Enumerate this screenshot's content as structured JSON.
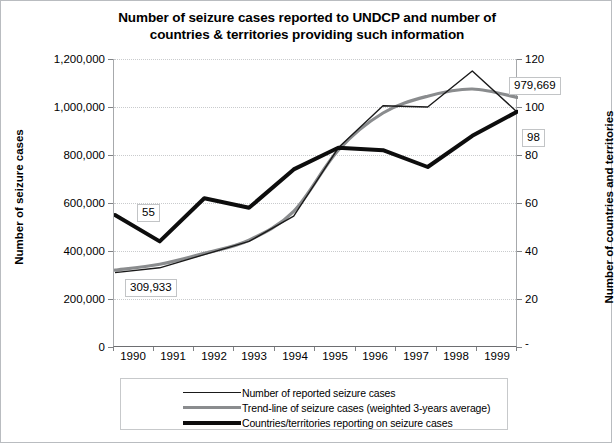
{
  "chart_data": {
    "type": "line",
    "title": "Number of seizure cases reported to UNDCP and number of countries & territories providing such information",
    "title_line1": "Number of seizure cases reported to UNDCP and number of",
    "title_line2": "countries & territories providing such information",
    "xlabel": "",
    "ylabel": "Number of seizure cases",
    "ylabel_right": "Number of countries and territories",
    "categories": [
      "1990",
      "1991",
      "1992",
      "1993",
      "1994",
      "1995",
      "1996",
      "1997",
      "1998",
      "1999"
    ],
    "x": [
      1990,
      1991,
      1992,
      1993,
      1994,
      1995,
      1996,
      1997,
      1998,
      1999
    ],
    "ylim": [
      0,
      1200000
    ],
    "ylim_right": [
      0,
      120
    ],
    "yticks": [
      "0",
      "200,000",
      "400,000",
      "600,000",
      "800,000",
      "1,000,000",
      "1,200,000"
    ],
    "ytick_values": [
      0,
      200000,
      400000,
      600000,
      800000,
      1000000,
      1200000
    ],
    "yticks_right": [
      "-",
      "20",
      "40",
      "60",
      "80",
      "100",
      "120"
    ],
    "ytick_values_right": [
      0,
      20,
      40,
      60,
      80,
      100,
      120
    ],
    "grid": true,
    "legend_position": "bottom",
    "series": [
      {
        "name": "Number of reported seizure cases",
        "axis": "left",
        "style": "thin-black",
        "color": "#1a1a1a",
        "values": [
          309933,
          330000,
          385000,
          440000,
          545000,
          830000,
          1005000,
          1000000,
          1150000,
          979669
        ]
      },
      {
        "name": "Trend-line of seizure cases (weighted 3-years average)",
        "axis": "left",
        "style": "gray-smooth",
        "color": "#8a8c8e",
        "values": [
          320000,
          345000,
          390000,
          445000,
          565000,
          820000,
          975000,
          1045000,
          1075000,
          1040000
        ]
      },
      {
        "name": "Countries/territories reporting on seizure cases",
        "axis": "right",
        "style": "thick-black",
        "color": "#0d0d0d",
        "values": [
          55,
          44,
          62,
          58,
          74,
          83,
          82,
          75,
          88,
          98
        ]
      }
    ],
    "annotations": [
      {
        "text": "55",
        "series": "Countries/territories reporting on seizure cases",
        "x": "1990",
        "value": 55
      },
      {
        "text": "309,933",
        "series": "Number of reported seizure cases",
        "x": "1990",
        "value": 309933
      },
      {
        "text": "979,669",
        "series": "Number of reported seizure cases",
        "x": "1999",
        "value": 979669
      },
      {
        "text": "98",
        "series": "Countries/territories reporting on seizure cases",
        "x": "1999",
        "value": 98
      }
    ]
  },
  "legend": {
    "items": [
      {
        "label": "Number of reported seizure cases"
      },
      {
        "label": "Trend-line of seizure cases (weighted 3-years average)"
      },
      {
        "label": "Countries/territories reporting on seizure cases"
      }
    ]
  },
  "colors": {
    "series_thin": "#1a1a1a",
    "series_trend": "#8a8c8e",
    "series_countries": "#0d0d0d",
    "grid": "#c9cbcd",
    "axis": "#808285",
    "background": "#ffffff"
  }
}
